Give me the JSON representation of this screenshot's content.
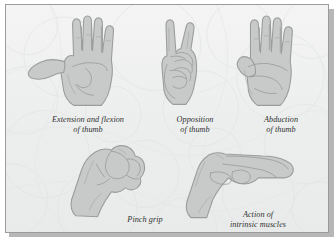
{
  "figure": {
    "kind": "anatomy-illustration-panel",
    "background_color": "#eef0ef",
    "border_color": "#9a9c9b",
    "hand_fill_color": "#c9cbca",
    "hand_outline_color": "#9b9d9c",
    "caption_color": "#2f3132",
    "items": [
      {
        "id": "extension-flexion-thumb",
        "icon": "hand-thumb-extension-flexion-icon",
        "caption_lines": [
          "Extension and flexion",
          "of thumb"
        ]
      },
      {
        "id": "opposition-thumb",
        "icon": "hand-thumb-opposition-icon",
        "caption_lines": [
          "Opposition",
          "of thumb"
        ]
      },
      {
        "id": "abduction-thumb",
        "icon": "hand-thumb-abduction-icon",
        "caption_lines": [
          "Abduction",
          "of thumb"
        ]
      },
      {
        "id": "pinch-grip",
        "icon": "hand-pinch-grip-icon",
        "caption_lines": [
          "Pinch grip"
        ]
      },
      {
        "id": "intrinsic-muscles",
        "icon": "hand-intrinsic-muscles-icon",
        "caption_lines": [
          "Action of",
          "intrinsic muscles"
        ]
      }
    ]
  }
}
